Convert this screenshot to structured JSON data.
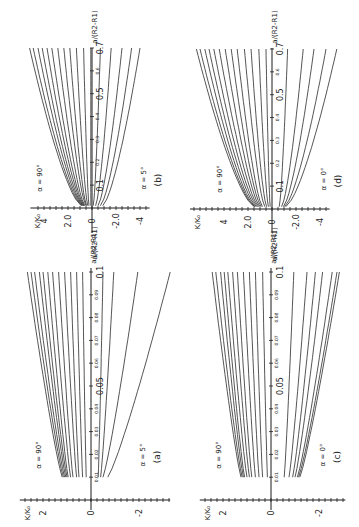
{
  "figure": {
    "orientation": "rotated 90 degrees counter-clockwise (x-axis runs upward, K/K0 axis runs horizontally with positive values to the left)",
    "background": "#ffffff",
    "ink": "#2a2a2a"
  },
  "chart_data": [
    {
      "panel": "(b)",
      "type": "line",
      "xlabel": "a/(R2-R1)",
      "ylabel": "K/K0",
      "xlim": [
        0,
        0.7
      ],
      "ylim": [
        -5,
        5
      ],
      "x_ticks": [
        "0.1",
        "0.2",
        "0.3",
        "0.4",
        "0.5",
        "0.6",
        "0.7"
      ],
      "y_ticks": [
        "4",
        "2.0",
        "0",
        "-2.0",
        "-4"
      ],
      "annotations": [
        "α = 90°",
        "α = 5°"
      ],
      "layout": {
        "x0": 92,
        "y0": 208,
        "sK": 12,
        "sA": 228.6,
        "top": 45,
        "bottom": 243,
        "kmin": -4.8,
        "kmax": 4.8
      },
      "x_start": 0.01,
      "x_end": 0.7,
      "series_note": "family of curves from α = 90° (top) down to α = 5° (bottom)",
      "series": [
        {
          "start": 0.9,
          "end": 5.2
        },
        {
          "start": 0.85,
          "end": 4.9
        },
        {
          "start": 0.8,
          "end": 4.5
        },
        {
          "start": 0.75,
          "end": 4.15
        },
        {
          "start": 0.7,
          "end": 3.75
        },
        {
          "start": 0.65,
          "end": 3.35
        },
        {
          "start": 0.6,
          "end": 2.85
        },
        {
          "start": 0.5,
          "end": 2.35
        },
        {
          "start": 0.45,
          "end": 1.85
        },
        {
          "start": 0.35,
          "end": 1.3
        },
        {
          "start": 0.25,
          "end": 0.7
        },
        {
          "start": 0.1,
          "end": 0.1
        },
        {
          "start": -0.1,
          "end": -0.7
        },
        {
          "start": -0.3,
          "end": -1.6
        },
        {
          "start": -0.5,
          "end": -2.5
        },
        {
          "start": -0.7,
          "end": -3.3
        },
        {
          "start": -0.9,
          "end": -4.0
        }
      ]
    },
    {
      "panel": "(a)",
      "type": "line",
      "xlabel": "a/(R2-R1)",
      "ylabel": "K/K0",
      "xlim": [
        0,
        0.1
      ],
      "ylim": [
        -3,
        3
      ],
      "x_ticks": [
        "0.01",
        "0.02",
        "0.03",
        "0.04",
        "0.05",
        "0.06",
        "0.07",
        "0.08",
        "0.09",
        "0.1"
      ],
      "y_ticks": [
        "2",
        "0",
        "-2"
      ],
      "annotations": [
        "α = 90°",
        "α = 5°"
      ],
      "layout": {
        "x0": 91,
        "y0": 500,
        "sK": 24,
        "sA": 2280,
        "top": 265,
        "bottom": 520,
        "kmin": -3.3,
        "kmax": 2.8
      },
      "x_start": 0.01,
      "x_end": 0.1,
      "series_note": "family of curves from α = 90° (top) down to α = 5° (bottom)",
      "series": [
        {
          "start": 1.2,
          "end": 2.65
        },
        {
          "start": 1.15,
          "end": 2.5
        },
        {
          "start": 1.1,
          "end": 2.35
        },
        {
          "start": 1.05,
          "end": 2.15
        },
        {
          "start": 1.0,
          "end": 2.0
        },
        {
          "start": 0.95,
          "end": 1.8
        },
        {
          "start": 0.85,
          "end": 1.6
        },
        {
          "start": 0.75,
          "end": 1.35
        },
        {
          "start": 0.6,
          "end": 1.1
        },
        {
          "start": 0.5,
          "end": 0.85
        },
        {
          "start": 0.35,
          "end": 0.6
        },
        {
          "start": 0.2,
          "end": 0.35
        },
        {
          "start": -0.3,
          "end": -0.5
        },
        {
          "start": -0.4,
          "end": -0.95
        },
        {
          "start": -0.5,
          "end": -1.95
        },
        {
          "start": -0.7,
          "end": -3.3
        }
      ]
    },
    {
      "panel": "(d)",
      "type": "line",
      "xlabel": "a/(R2-R1)",
      "ylabel": "K/K0",
      "xlim": [
        0,
        0.7
      ],
      "ylim": [
        -5,
        5
      ],
      "x_ticks": [
        "0.1",
        "0.2",
        "0.3",
        "0.4",
        "0.5",
        "0.6",
        "0.7"
      ],
      "y_ticks": [
        "4",
        "2.0",
        "0",
        "-2.0",
        "-4"
      ],
      "annotations": [
        "α = 90°",
        "α = 0°"
      ],
      "layout": {
        "x0": 272,
        "y0": 209,
        "sK": 12,
        "sA": 228.6,
        "top": 45,
        "bottom": 243,
        "kmin": -4.8,
        "kmax": 6.5
      },
      "x_start": 0.01,
      "x_end": 0.7,
      "series_note": "family of curves from α = 90° (top) down to α = 0° (bottom)",
      "series": [
        {
          "start": 1.5,
          "end": 6.3
        },
        {
          "start": 1.45,
          "end": 6.0
        },
        {
          "start": 1.4,
          "end": 5.6
        },
        {
          "start": 1.3,
          "end": 5.25
        },
        {
          "start": 1.2,
          "end": 4.85
        },
        {
          "start": 1.1,
          "end": 4.4
        },
        {
          "start": 1.0,
          "end": 3.9
        },
        {
          "start": 0.9,
          "end": 3.4
        },
        {
          "start": 0.8,
          "end": 2.9
        },
        {
          "start": 0.6,
          "end": 2.3
        },
        {
          "start": 0.45,
          "end": 1.75
        },
        {
          "start": 0.3,
          "end": 1.1
        },
        {
          "start": 0.15,
          "end": 0.5
        },
        {
          "start": -0.6,
          "end": -1.3
        },
        {
          "start": -0.8,
          "end": -2.6
        },
        {
          "start": -0.95,
          "end": -3.5
        },
        {
          "start": -1.05,
          "end": -4.5
        },
        {
          "start": -1.15,
          "end": -5.4
        }
      ]
    },
    {
      "panel": "(c)",
      "type": "line",
      "xlabel": "a/(R2-R1)",
      "ylabel": "K/K0",
      "xlim": [
        0,
        0.1
      ],
      "ylim": [
        -3,
        3
      ],
      "x_ticks": [
        "0.01",
        "0.02",
        "0.03",
        "0.04",
        "0.05",
        "0.06",
        "0.07",
        "0.08",
        "0.09",
        "0.1"
      ],
      "y_ticks": [
        "2",
        "0",
        "-2"
      ],
      "annotations": [
        "α = 90°",
        "α = 0°"
      ],
      "layout": {
        "x0": 271,
        "y0": 500,
        "sK": 24,
        "sA": 2280,
        "top": 265,
        "bottom": 520,
        "kmin": -3.1,
        "kmax": 2.8
      },
      "x_start": 0.01,
      "x_end": 0.1,
      "series_note": "family of curves from α = 90° (top) down to α = 0° (bottom)",
      "series": [
        {
          "start": 1.25,
          "end": 2.45
        },
        {
          "start": 1.2,
          "end": 2.3
        },
        {
          "start": 1.15,
          "end": 2.1
        },
        {
          "start": 1.1,
          "end": 1.95
        },
        {
          "start": 1.0,
          "end": 1.8
        },
        {
          "start": 0.9,
          "end": 1.6
        },
        {
          "start": 0.8,
          "end": 1.4
        },
        {
          "start": 0.65,
          "end": 1.15
        },
        {
          "start": 0.5,
          "end": 0.9
        },
        {
          "start": 0.35,
          "end": 0.65
        },
        {
          "start": 0.15,
          "end": 0.35
        },
        {
          "start": -0.55,
          "end": -0.95
        },
        {
          "start": -0.75,
          "end": -1.5
        },
        {
          "start": -0.9,
          "end": -1.85
        },
        {
          "start": -1.0,
          "end": -2.15
        },
        {
          "start": -1.1,
          "end": -2.55
        },
        {
          "start": -1.15,
          "end": -2.75
        },
        {
          "start": -1.2,
          "end": -2.85
        }
      ]
    }
  ]
}
